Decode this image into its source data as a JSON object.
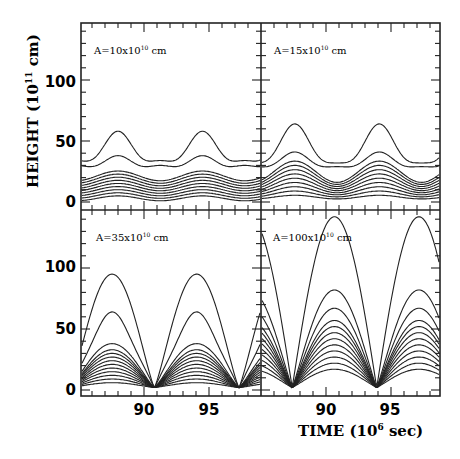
{
  "chart_data": {
    "type": "line",
    "layout": "2x2 panels sharing axes",
    "xlabel": "TIME (10^6 sec)",
    "ylabel": "HEIGHT (10^11 cm)",
    "xlim": [
      85.2,
      98.8
    ],
    "ylim": [
      -5,
      145
    ],
    "xticks": [
      90,
      95
    ],
    "yticks": [
      0,
      50,
      100
    ],
    "grid": false,
    "panels": [
      {
        "id": "top-left",
        "label": "A=10x10^10 cm",
        "curves": 11,
        "max_height": 55,
        "period": 6.5,
        "shape": "low-amplitude double-hump waves"
      },
      {
        "id": "top-right",
        "label": "A=15x10^10 cm",
        "curves": 11,
        "max_height": 62,
        "period": 6.5,
        "shape": "low-amplitude waves with cusps near zero"
      },
      {
        "id": "bottom-left",
        "label": "A=35x10^10 cm",
        "curves": 12,
        "max_height": 93,
        "period": 6.5,
        "shape": "arched curves with cusps near 0 at ~90.8 and ~97.3"
      },
      {
        "id": "bottom-right",
        "label": "A=100x10^10 cm",
        "curves": 12,
        "max_height": 140,
        "period": 6.5,
        "shape": "large arcs peaking ~90.7 and ~97.2, minima ~87 and ~94"
      }
    ]
  },
  "axes": {
    "xlabel_text": "TIME (10",
    "xlabel_exp": "6",
    "xlabel_tail": " sec)",
    "ylabel_text": "HEIGHT (10",
    "ylabel_exp": "11",
    "ylabel_tail": " cm)",
    "ytick_labels": [
      "0",
      "50",
      "100"
    ],
    "xtick_labels": [
      "90",
      "95"
    ]
  },
  "panels": [
    {
      "pre": "A=10x10",
      "exp": "10",
      "post": " cm"
    },
    {
      "pre": "A=15x10",
      "exp": "10",
      "post": " cm"
    },
    {
      "pre": "A=35x10",
      "exp": "10",
      "post": " cm"
    },
    {
      "pre": "A=100x10",
      "exp": "10",
      "post": " cm"
    }
  ],
  "colors": {
    "line": "#222222",
    "background": "#ffffff"
  }
}
